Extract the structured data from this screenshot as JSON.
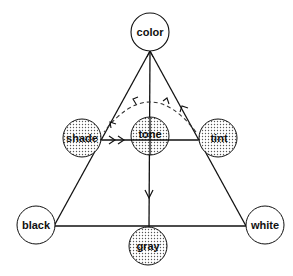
{
  "diagram": {
    "type": "color-triangle",
    "nodes": {
      "color": {
        "label": "color",
        "shaded": false
      },
      "shade": {
        "label": "shade",
        "shaded": true
      },
      "tone": {
        "label": "tone",
        "shaded": true
      },
      "tint": {
        "label": "tint",
        "shaded": true
      },
      "black": {
        "label": "black",
        "shaded": false
      },
      "white": {
        "label": "white",
        "shaded": false
      },
      "gray": {
        "label": "gray",
        "shaded": true
      }
    },
    "edges": [
      {
        "from": "color",
        "to": "black",
        "style": "solid"
      },
      {
        "from": "color",
        "to": "white",
        "style": "solid"
      },
      {
        "from": "black",
        "to": "white",
        "style": "solid"
      },
      {
        "from": "color",
        "to": "gray",
        "style": "solid",
        "arrow": "down"
      },
      {
        "from": "shade",
        "to": "tint",
        "style": "solid",
        "arrow": "toward-tone"
      },
      {
        "from": "tint",
        "to": "shade",
        "style": "dashed-arc",
        "arrow": "toward-shade"
      }
    ],
    "colors": {
      "stroke": "#111111",
      "shaded_fill_dot": "#555555",
      "background": "#ffffff"
    }
  },
  "caption": {
    "text": ""
  }
}
